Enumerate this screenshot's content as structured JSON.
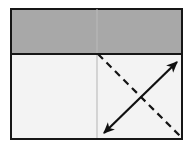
{
  "figure": {
    "title": "",
    "canvas": {
      "width": 192,
      "height": 151,
      "background": "#ffffff"
    },
    "frame": {
      "label": "outer-rectangle",
      "x": 11,
      "y": 9,
      "width": 171,
      "height": 130,
      "stroke": "#161616",
      "stroke_width": 2.6,
      "fill": "#f3f3f3"
    },
    "shaded_band": {
      "label": "gray-upper-band",
      "x": 11,
      "y": 9,
      "width": 171,
      "height": 45,
      "fill": "#a8a8a8",
      "stroke": "#161616",
      "stroke_width": 2.6
    },
    "divider": {
      "label": "horizontal-divider",
      "x1": 11,
      "y1": 54,
      "x2": 182,
      "y2": 54,
      "stroke": "#161616",
      "stroke_width": 2.4
    },
    "center_line": {
      "label": "vertical-center-line",
      "x1": 97,
      "y1": 9,
      "x2": 97,
      "y2": 138,
      "stroke": "#b9b9b9",
      "stroke_width": 1.1
    },
    "solid_arrow": {
      "label": "double-headed-solid-arrow",
      "style": "solid",
      "heads": "both",
      "x1": 104,
      "y1": 133,
      "x2": 177,
      "y2": 62,
      "stroke": "#101010",
      "stroke_width": 2.2,
      "head_length": 11,
      "head_width": 7
    },
    "dashed_line": {
      "label": "dashed-diagonal-line",
      "style": "dashed",
      "heads": "none",
      "x1": 98,
      "y1": 54,
      "x2": 182,
      "y2": 138,
      "stroke": "#141414",
      "stroke_width": 2.2,
      "dash_pattern": "7 5"
    }
  }
}
